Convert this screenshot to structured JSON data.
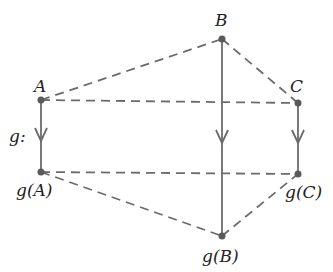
{
  "diagram": {
    "title": "",
    "line_color": "#6b6b6b",
    "nodes": [
      {
        "id": "A",
        "label": "A",
        "x": 41,
        "y": 100
      },
      {
        "id": "B",
        "label": "B",
        "x": 222,
        "y": 39
      },
      {
        "id": "C",
        "label": "C",
        "x": 298,
        "y": 103
      },
      {
        "id": "gA",
        "label": "g(A)",
        "x": 41,
        "y": 172
      },
      {
        "id": "gB",
        "label": "g(B)",
        "x": 222,
        "y": 236
      },
      {
        "id": "gC",
        "label": "g(C)",
        "x": 298,
        "y": 174
      }
    ],
    "map_label": "g:",
    "edges_dashed": [
      [
        "A",
        "B"
      ],
      [
        "B",
        "C"
      ],
      [
        "A",
        "C"
      ],
      [
        "gA",
        "gB"
      ],
      [
        "gB",
        "gC"
      ],
      [
        "gA",
        "gC"
      ]
    ],
    "arrows": [
      [
        "A",
        "gA"
      ],
      [
        "B",
        "gB"
      ],
      [
        "C",
        "gC"
      ]
    ]
  }
}
